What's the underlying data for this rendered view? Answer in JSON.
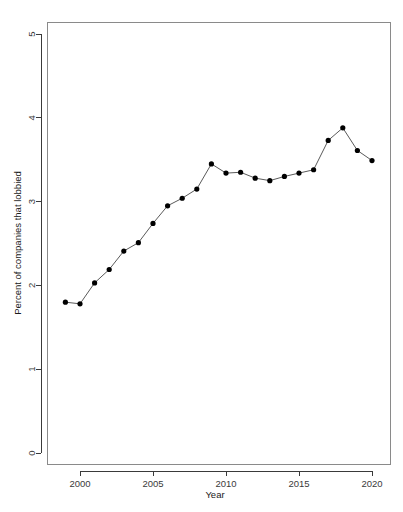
{
  "chart_data": {
    "type": "line",
    "title": "",
    "xlabel": "Year",
    "ylabel": "Percent of companies that lobbied",
    "xlim": [
      1998.2,
      2021.0
    ],
    "ylim": [
      0,
      5.25
    ],
    "xticks": [
      2000,
      2005,
      2010,
      2015,
      2020
    ],
    "yticks": [
      0,
      1,
      2,
      3,
      4,
      5
    ],
    "grid": false,
    "legend": "none",
    "marker": "filled-circle",
    "line_style": "solid",
    "x": [
      1999,
      2000,
      2001,
      2002,
      2003,
      2004,
      2005,
      2006,
      2007,
      2008,
      2009,
      2010,
      2011,
      2012,
      2013,
      2014,
      2015,
      2016,
      2017,
      2018,
      2019,
      2020
    ],
    "values": [
      1.8,
      1.78,
      2.03,
      2.19,
      2.41,
      2.51,
      2.74,
      2.95,
      3.04,
      3.15,
      3.45,
      3.34,
      3.35,
      3.28,
      3.25,
      3.3,
      3.34,
      3.38,
      3.73,
      3.88,
      3.61,
      3.49
    ],
    "series": [
      {
        "name": "Percent of companies that lobbied",
        "values": [
          1.8,
          1.78,
          2.03,
          2.19,
          2.41,
          2.51,
          2.74,
          2.95,
          3.04,
          3.15,
          3.45,
          3.34,
          3.35,
          3.28,
          3.25,
          3.3,
          3.34,
          3.38,
          3.73,
          3.88,
          3.61,
          3.49
        ]
      }
    ],
    "colors": {
      "line": "#5a5a5a",
      "point": "#000000",
      "axis": "#3a3a3a",
      "background": "#ffffff"
    }
  },
  "axes": {
    "x_title": "Year",
    "y_title": "Percent of companies that lobbied",
    "x_tick_labels": [
      "2000",
      "2005",
      "2010",
      "2015",
      "2020"
    ],
    "y_tick_labels": [
      "0",
      "1",
      "2",
      "3",
      "4",
      "5"
    ]
  }
}
